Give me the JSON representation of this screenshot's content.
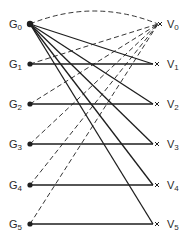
{
  "diagram": {
    "type": "bipartite-graph",
    "colors": {
      "stroke": "#1e1e1e",
      "text": "#2a2a2a",
      "background": "#ffffff"
    },
    "left_nodes": [
      {
        "id": "G0",
        "base": "G",
        "sub": "0",
        "x": 30,
        "y": 24
      },
      {
        "id": "G1",
        "base": "G",
        "sub": "1",
        "x": 30,
        "y": 64
      },
      {
        "id": "G2",
        "base": "G",
        "sub": "2",
        "x": 30,
        "y": 104
      },
      {
        "id": "G3",
        "base": "G",
        "sub": "3",
        "x": 30,
        "y": 144
      },
      {
        "id": "G4",
        "base": "G",
        "sub": "4",
        "x": 30,
        "y": 185
      },
      {
        "id": "G5",
        "base": "G",
        "sub": "5",
        "x": 30,
        "y": 224
      }
    ],
    "right_nodes": [
      {
        "id": "V0",
        "base": "V",
        "sub": "0",
        "x": 158,
        "y": 24,
        "marker": "x"
      },
      {
        "id": "V1",
        "base": "V",
        "sub": "1",
        "x": 155,
        "y": 64,
        "marker": "x"
      },
      {
        "id": "V2",
        "base": "V",
        "sub": "2",
        "x": 155,
        "y": 104,
        "marker": "x"
      },
      {
        "id": "V3",
        "base": "V",
        "sub": "3",
        "x": 155,
        "y": 144,
        "marker": "x"
      },
      {
        "id": "V4",
        "base": "V",
        "sub": "4",
        "x": 155,
        "y": 185,
        "marker": "x"
      },
      {
        "id": "V5",
        "base": "V",
        "sub": "5",
        "x": 155,
        "y": 224,
        "marker": "x"
      }
    ],
    "solid_edges": [
      [
        "G0",
        "V1"
      ],
      [
        "G0",
        "V2"
      ],
      [
        "G0",
        "V3"
      ],
      [
        "G0",
        "V4"
      ],
      [
        "G0",
        "V5"
      ],
      [
        "G1",
        "V1"
      ],
      [
        "G2",
        "V2"
      ],
      [
        "G3",
        "V3"
      ],
      [
        "G4",
        "V4"
      ],
      [
        "G5",
        "V5"
      ]
    ],
    "dashed_edges": [
      [
        "G1",
        "V0"
      ],
      [
        "G2",
        "V0"
      ],
      [
        "G3",
        "V0"
      ],
      [
        "G4",
        "V0"
      ],
      [
        "G5",
        "V0"
      ]
    ],
    "dashed_arc": [
      "G0",
      "V0"
    ]
  }
}
